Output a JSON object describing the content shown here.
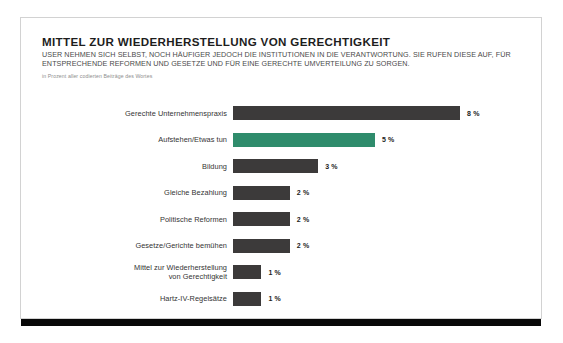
{
  "card": {
    "title": "MITTEL ZUR WIEDERHERSTELLUNG VON GERECHTIGKEIT",
    "deck": "USER NEHMEN SICH SELBST, NOCH HÄUFIGER JEDOCH DIE INSTITUTIONEN IN DIE VERANTWORTUNG. SIE RUFEN DIESE AUF, FÜR ENTSPRECHENDE REFORMEN UND GESETZE UND FÜR EINE GERECHTE UMVERTEILUNG ZU SORGEN.",
    "unit_note": "in Prozent aller codierten Beiträge des Wortes"
  },
  "colors": {
    "bar_default": "#3c3a3a",
    "bar_accent": "#2f8c6c",
    "card_border": "#d2d2d2",
    "rule": "#080808"
  },
  "chart_data": {
    "type": "bar",
    "orientation": "horizontal",
    "title": "MITTEL ZUR WIEDERHERSTELLUNG VON GERECHTIGKEIT",
    "subtitle": "USER NEHMEN SICH SELBST, NOCH HÄUFIGER JEDOCH DIE INSTITUTIONEN IN DIE VERANTWORTUNG. SIE RUFEN DIESE AUF, FÜR ENTSPRECHENDE REFORMEN UND GESETZE UND FÜR EINE GERECHTE UMVERTEILUNG ZU SORGEN.",
    "unit_label": "in Prozent aller codierten Beiträge des Wortes",
    "xlabel": "",
    "ylabel": "",
    "xlim": [
      0,
      8
    ],
    "grid": false,
    "legend": "none",
    "value_suffix": " %",
    "categories": [
      "Gerechte Unternehmenspraxis",
      "Aufstehen/Etwas tun",
      "Bildung",
      "Gleiche Bezahlung",
      "Politische Reformen",
      "Gesetze/Gerichte bemühen",
      "Mittel zur Wiederherstellung von Gerechtigkeit",
      "Hartz-IV-Regelsätze"
    ],
    "values": [
      8,
      5,
      3,
      2,
      2,
      2,
      1,
      1
    ],
    "value_labels": [
      "8 %",
      "5 %",
      "3 %",
      "2 %",
      "2 %",
      "2 %",
      "1 %",
      "1 %"
    ],
    "highlighted_index": 1,
    "bars": [
      {
        "label": "Gerechte Unternehmenspraxis",
        "label_lines": [
          "Gerechte Unternehmenspraxis"
        ],
        "value": 8,
        "value_label": "8 %",
        "highlight": false
      },
      {
        "label": "Aufstehen/Etwas tun",
        "label_lines": [
          "Aufstehen/Etwas tun"
        ],
        "value": 5,
        "value_label": "5 %",
        "highlight": true
      },
      {
        "label": "Bildung",
        "label_lines": [
          "Bildung"
        ],
        "value": 3,
        "value_label": "3 %",
        "highlight": false
      },
      {
        "label": "Gleiche Bezahlung",
        "label_lines": [
          "Gleiche Bezahlung"
        ],
        "value": 2,
        "value_label": "2 %",
        "highlight": false
      },
      {
        "label": "Politische Reformen",
        "label_lines": [
          "Politische Reformen"
        ],
        "value": 2,
        "value_label": "2 %",
        "highlight": false
      },
      {
        "label": "Gesetze/Gerichte bemühen",
        "label_lines": [
          "Gesetze/Gerichte bemühen"
        ],
        "value": 2,
        "value_label": "2 %",
        "highlight": false
      },
      {
        "label": "Mittel zur Wiederherstellung von Gerechtigkeit",
        "label_lines": [
          "Mittel zur Wiederherstellung",
          "von Gerechtigkeit"
        ],
        "value": 1,
        "value_label": "1 %",
        "highlight": false
      },
      {
        "label": "Hartz-IV-Regelsätze",
        "label_lines": [
          "Hartz-IV-Regelsätze"
        ],
        "value": 1,
        "value_label": "1 %",
        "highlight": false
      }
    ]
  }
}
